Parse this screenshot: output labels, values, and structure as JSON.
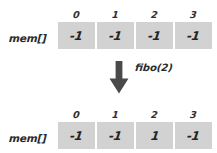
{
  "diagram": {
    "cell_color": "#d2d2d2",
    "text_color": "#232323",
    "arrow_color": "#4a4a4a",
    "rows": [
      {
        "label": "mem[]",
        "indices": [
          "0",
          "1",
          "2",
          "3"
        ],
        "values": [
          "-1",
          "-1",
          "-1",
          "-1"
        ]
      },
      {
        "label": "mem[]",
        "indices": [
          "0",
          "1",
          "2",
          "3"
        ],
        "values": [
          "-1",
          "-1",
          "1",
          "-1"
        ]
      }
    ],
    "transition": {
      "icon": "arrow-down-icon",
      "label": "fibo(2)"
    }
  }
}
